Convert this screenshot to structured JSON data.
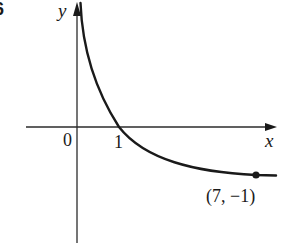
{
  "figure": {
    "panel_label": "6",
    "axes": {
      "x_label": "x",
      "y_label": "y",
      "origin_label": "0"
    },
    "tick_labels": {
      "x_intercept": "1"
    },
    "annotations": {
      "point_label": "(7, −1)"
    },
    "curve": {
      "description": "decreasing curve with vertical asymptote at the y-axis, passing through (1, 0) and (7, -1), leveling off toward the right",
      "passes_through": [
        [
          1,
          0
        ],
        [
          7,
          -1
        ]
      ],
      "vertical_asymptote": "x = 0",
      "color": "#1a1a1a"
    },
    "colors": {
      "ink": "#1a1a1a",
      "axis": "#2b2b2b",
      "background": "#ffffff"
    }
  }
}
